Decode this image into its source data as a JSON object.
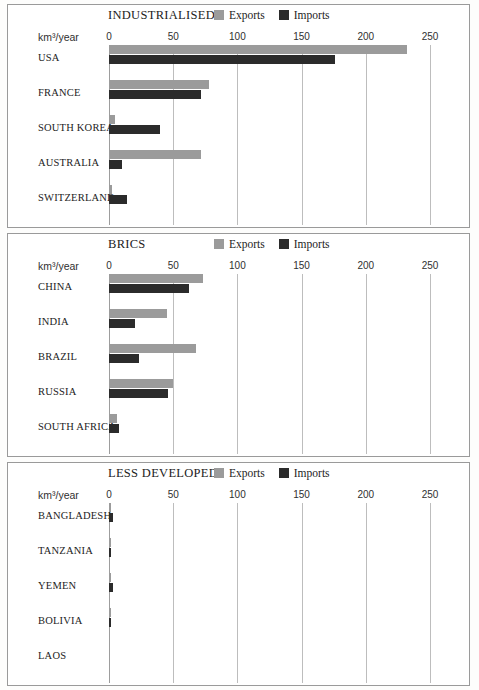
{
  "figure": {
    "axis_unit_label": "km³/year",
    "tick_labels": [
      "0",
      "50",
      "100",
      "150",
      "200",
      "250"
    ],
    "legend": {
      "exports_label": "Exports",
      "imports_label": "Imports",
      "exports_color": "#9b9b9b",
      "imports_color": "#2b2b2b"
    }
  },
  "chart_data": [
    {
      "type": "bar",
      "title": "INDUSTRIALISED",
      "orientation": "horizontal",
      "xlabel": "km³/year",
      "ylabel": "",
      "xlim": [
        0,
        270
      ],
      "xticks": [
        0,
        50,
        100,
        150,
        200,
        250
      ],
      "grid": true,
      "legend_position": "top-right",
      "categories": [
        "USA",
        "FRANCE",
        "SOUTH KOREA",
        "AUSTRALIA",
        "SWITZERLAND"
      ],
      "series": [
        {
          "name": "Exports",
          "color": "#9b9b9b",
          "values": [
            232,
            78,
            5,
            72,
            2
          ]
        },
        {
          "name": "Imports",
          "color": "#2b2b2b",
          "values": [
            176,
            72,
            40,
            10,
            14
          ]
        }
      ]
    },
    {
      "type": "bar",
      "title": "BRICS",
      "orientation": "horizontal",
      "xlabel": "km³/year",
      "ylabel": "",
      "xlim": [
        0,
        270
      ],
      "xticks": [
        0,
        50,
        100,
        150,
        200,
        250
      ],
      "grid": true,
      "legend_position": "top-right",
      "categories": [
        "CHINA",
        "INDIA",
        "BRAZIL",
        "RUSSIA",
        "SOUTH AFRICA"
      ],
      "series": [
        {
          "name": "Exports",
          "color": "#9b9b9b",
          "values": [
            73,
            45,
            68,
            50,
            6
          ]
        },
        {
          "name": "Imports",
          "color": "#2b2b2b",
          "values": [
            62,
            20,
            23,
            46,
            8
          ]
        }
      ]
    },
    {
      "type": "bar",
      "title": "LESS DEVELOPED",
      "orientation": "horizontal",
      "xlabel": "km³/year",
      "ylabel": "",
      "xlim": [
        0,
        270
      ],
      "xticks": [
        0,
        50,
        100,
        150,
        200,
        250
      ],
      "grid": true,
      "legend_position": "top-right",
      "categories": [
        "BANGLADESH",
        "TANZANIA",
        "YEMEN",
        "BOLIVIA",
        "LAOS"
      ],
      "series": [
        {
          "name": "Exports",
          "color": "#9b9b9b",
          "values": [
            1,
            1.2,
            0.6,
            1.2,
            0
          ]
        },
        {
          "name": "Imports",
          "color": "#2b2b2b",
          "values": [
            3.5,
            0.7,
            3.2,
            0.6,
            0
          ]
        }
      ]
    }
  ]
}
